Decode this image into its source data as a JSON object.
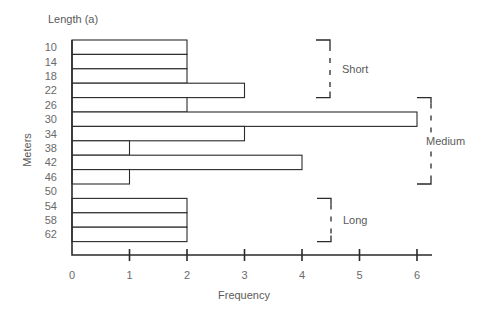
{
  "chart_data": {
    "type": "bar",
    "orientation": "horizontal",
    "title": "Length (a)",
    "xlabel": "Frequency",
    "ylabel": "Meters",
    "categories": [
      "10",
      "14",
      "18",
      "22",
      "26",
      "30",
      "34",
      "38",
      "42",
      "46",
      "50",
      "54",
      "58",
      "62"
    ],
    "values": [
      2,
      2,
      2,
      3,
      2,
      6,
      3,
      1,
      4,
      1,
      0,
      2,
      2,
      2
    ],
    "xlim": [
      0,
      6
    ],
    "xticks": [
      "0",
      "1",
      "2",
      "3",
      "4",
      "5",
      "6"
    ],
    "grid": false,
    "annotations": [
      {
        "label": "Short",
        "from": "10",
        "to": "22"
      },
      {
        "label": "Medium",
        "from": "26",
        "to": "46"
      },
      {
        "label": "Long",
        "from": "54",
        "to": "62"
      }
    ]
  }
}
